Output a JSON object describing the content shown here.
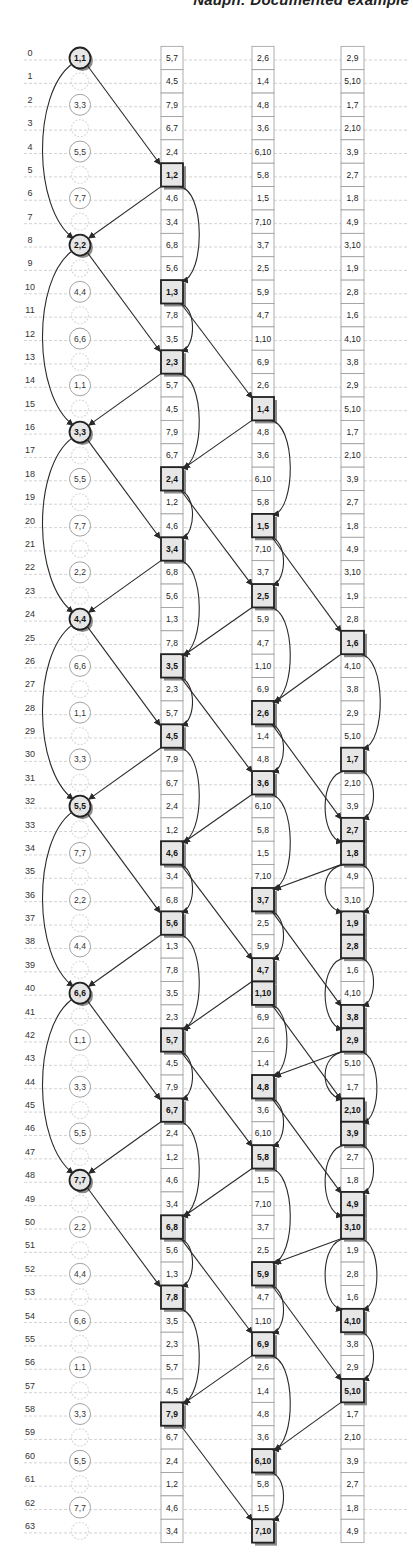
{
  "title": "Naupn: Documented example",
  "layout": {
    "row_count": 64,
    "row0_y": 58,
    "row_pitch": 23.38,
    "rownum_x": 30,
    "grid_x1": 24,
    "grid_x2": 408,
    "circle_x": 80,
    "circle_r": 10.5,
    "columns_x": [
      172,
      263,
      352.5
    ],
    "column_widths": [
      22,
      22,
      23
    ]
  },
  "colors": {
    "grid": "#c8c8c8",
    "cell_border": "#9a9a9a",
    "hl_border": "#222222",
    "hl_fill": "#e6e6e6",
    "shadow": "#8c8c8c",
    "arrow": "#2a2a2a",
    "ghost": "#dcdcdc"
  },
  "circles": [
    {
      "row": 0,
      "label": "1,1",
      "hl": true
    },
    {
      "row": 2,
      "label": "3,3",
      "hl": false
    },
    {
      "row": 4,
      "label": "5,5",
      "hl": false
    },
    {
      "row": 6,
      "label": "7,7",
      "hl": false
    },
    {
      "row": 8,
      "label": "2,2",
      "hl": true
    },
    {
      "row": 10,
      "label": "4,4",
      "hl": false
    },
    {
      "row": 12,
      "label": "6,6",
      "hl": false
    },
    {
      "row": 14,
      "label": "1,1",
      "hl": false
    },
    {
      "row": 16,
      "label": "3,3",
      "hl": true
    },
    {
      "row": 18,
      "label": "5,5",
      "hl": false
    },
    {
      "row": 20,
      "label": "7,7",
      "hl": false
    },
    {
      "row": 22,
      "label": "2,2",
      "hl": false
    },
    {
      "row": 24,
      "label": "4,4",
      "hl": true
    },
    {
      "row": 26,
      "label": "6,6",
      "hl": false
    },
    {
      "row": 28,
      "label": "1,1",
      "hl": false
    },
    {
      "row": 30,
      "label": "3,3",
      "hl": false
    },
    {
      "row": 32,
      "label": "5,5",
      "hl": true
    },
    {
      "row": 34,
      "label": "7,7",
      "hl": false
    },
    {
      "row": 36,
      "label": "2,2",
      "hl": false
    },
    {
      "row": 38,
      "label": "4,4",
      "hl": false
    },
    {
      "row": 40,
      "label": "6,6",
      "hl": true
    },
    {
      "row": 42,
      "label": "1,1",
      "hl": false
    },
    {
      "row": 44,
      "label": "3,3",
      "hl": false
    },
    {
      "row": 46,
      "label": "5,5",
      "hl": false
    },
    {
      "row": 48,
      "label": "7,7",
      "hl": true
    },
    {
      "row": 50,
      "label": "2,2",
      "hl": false
    },
    {
      "row": 52,
      "label": "4,4",
      "hl": false
    },
    {
      "row": 54,
      "label": "6,6",
      "hl": false
    },
    {
      "row": 56,
      "label": "1,1",
      "hl": false
    },
    {
      "row": 58,
      "label": "3,3",
      "hl": false
    },
    {
      "row": 60,
      "label": "5,5",
      "hl": false
    },
    {
      "row": 62,
      "label": "7,7",
      "hl": false
    }
  ],
  "columns": [
    {
      "cells": [
        "5,7",
        "4,5",
        "7,9",
        "6,7",
        "2,4",
        "1,2",
        "4,6",
        "3,4",
        "6,8",
        "5,6",
        "1,3",
        "7,8",
        "3,5",
        "2,3",
        "5,7",
        "4,5",
        "7,9",
        "6,7",
        "2,4",
        "1,2",
        "4,6",
        "3,4",
        "6,8",
        "5,6",
        "1,3",
        "7,8",
        "3,5",
        "2,3",
        "5,7",
        "4,5",
        "7,9",
        "6,7",
        "2,4",
        "1,2",
        "4,6",
        "3,4",
        "6,8",
        "5,6",
        "1,3",
        "7,8",
        "3,5",
        "2,3",
        "5,7",
        "4,5",
        "7,9",
        "6,7",
        "2,4",
        "1,2",
        "4,6",
        "3,4",
        "6,8",
        "5,6",
        "1,3",
        "7,8",
        "3,5",
        "2,3",
        "5,7",
        "4,5",
        "7,9",
        "6,7",
        "2,4",
        "1,2",
        "4,6",
        "3,4"
      ],
      "highlighted_rows": [
        5,
        10,
        13,
        18,
        21,
        26,
        29,
        34,
        37,
        42,
        45,
        50,
        53,
        58
      ]
    },
    {
      "cells": [
        "2,6",
        "1,4",
        "4,8",
        "3,6",
        "6,10",
        "5,8",
        "1,5",
        "7,10",
        "3,7",
        "2,5",
        "5,9",
        "4,7",
        "1,10",
        "6,9",
        "2,6",
        "1,4",
        "4,8",
        "3,6",
        "6,10",
        "5,8",
        "1,5",
        "7,10",
        "3,7",
        "2,5",
        "5,9",
        "4,7",
        "1,10",
        "6,9",
        "2,6",
        "1,4",
        "4,8",
        "3,6",
        "6,10",
        "5,8",
        "1,5",
        "7,10",
        "3,7",
        "2,5",
        "5,9",
        "4,7",
        "1,10",
        "6,9",
        "2,6",
        "1,4",
        "4,8",
        "3,6",
        "6,10",
        "5,8",
        "1,5",
        "7,10",
        "3,7",
        "2,5",
        "5,9",
        "4,7",
        "1,10",
        "6,9",
        "2,6",
        "1,4",
        "4,8",
        "3,6",
        "6,10",
        "5,8",
        "1,5",
        "7,10"
      ],
      "highlighted_rows": [
        15,
        20,
        23,
        28,
        31,
        36,
        39,
        40,
        44,
        47,
        52,
        55,
        60,
        63
      ]
    },
    {
      "cells": [
        "2,9",
        "5,10",
        "1,7",
        "2,10",
        "3,9",
        "2,7",
        "1,8",
        "4,9",
        "3,10",
        "1,9",
        "2,8",
        "1,6",
        "4,10",
        "3,8",
        "2,9",
        "5,10",
        "1,7",
        "2,10",
        "3,9",
        "2,7",
        "1,8",
        "4,9",
        "3,10",
        "1,9",
        "2,8",
        "1,6",
        "4,10",
        "3,8",
        "2,9",
        "5,10",
        "1,7",
        "2,10",
        "3,9",
        "2,7",
        "1,8",
        "4,9",
        "3,10",
        "1,9",
        "2,8",
        "1,6",
        "4,10",
        "3,8",
        "2,9",
        "5,10",
        "1,7",
        "2,10",
        "3,9",
        "2,7",
        "1,8",
        "4,9",
        "3,10",
        "1,9",
        "2,8",
        "1,6",
        "4,10",
        "3,8",
        "2,9",
        "5,10",
        "1,7",
        "2,10",
        "3,9",
        "2,7",
        "1,8",
        "4,9"
      ],
      "highlighted_rows": [
        25,
        30,
        33,
        34,
        37,
        38,
        41,
        42,
        45,
        46,
        49,
        50,
        54,
        57
      ]
    }
  ],
  "edges": {
    "circle_left_curves": [
      [
        0,
        8
      ],
      [
        8,
        16
      ],
      [
        16,
        24
      ],
      [
        24,
        32
      ],
      [
        32,
        40
      ],
      [
        40,
        48
      ]
    ],
    "circle_to_col": [
      [
        0,
        0,
        5
      ],
      [
        8,
        0,
        13
      ],
      [
        16,
        0,
        21
      ],
      [
        24,
        0,
        29
      ],
      [
        32,
        0,
        37
      ],
      [
        40,
        0,
        45
      ],
      [
        48,
        0,
        53
      ]
    ],
    "col_to_circle": [
      [
        0,
        5,
        8
      ],
      [
        0,
        13,
        16
      ],
      [
        0,
        21,
        24
      ],
      [
        0,
        29,
        32
      ],
      [
        0,
        37,
        40
      ],
      [
        0,
        45,
        48
      ]
    ],
    "col_right_curves": [
      [
        0,
        5,
        10
      ],
      [
        0,
        13,
        18
      ],
      [
        0,
        21,
        26
      ],
      [
        0,
        29,
        34
      ],
      [
        0,
        37,
        42
      ],
      [
        0,
        45,
        50
      ],
      [
        0,
        53,
        58
      ],
      [
        0,
        10,
        13
      ],
      [
        0,
        18,
        21
      ],
      [
        0,
        26,
        29
      ],
      [
        0,
        34,
        37
      ],
      [
        0,
        42,
        45
      ],
      [
        0,
        50,
        53
      ],
      [
        1,
        15,
        20
      ],
      [
        1,
        23,
        28
      ],
      [
        1,
        31,
        36
      ],
      [
        1,
        40,
        44
      ],
      [
        1,
        47,
        52
      ],
      [
        1,
        55,
        60
      ],
      [
        1,
        20,
        23
      ],
      [
        1,
        28,
        31
      ],
      [
        1,
        36,
        39
      ],
      [
        1,
        44,
        47
      ],
      [
        1,
        52,
        55
      ],
      [
        1,
        60,
        63
      ],
      [
        2,
        25,
        30
      ],
      [
        2,
        30,
        33
      ],
      [
        2,
        34,
        37
      ],
      [
        2,
        38,
        41
      ],
      [
        2,
        42,
        46
      ],
      [
        2,
        46,
        49
      ],
      [
        2,
        50,
        54
      ],
      [
        2,
        54,
        57
      ]
    ],
    "col_left_curves": [
      [
        2,
        30,
        34
      ],
      [
        2,
        34,
        37
      ],
      [
        2,
        38,
        42
      ],
      [
        2,
        42,
        45
      ],
      [
        2,
        46,
        50
      ],
      [
        2,
        50,
        54
      ]
    ],
    "cross_down": [
      [
        0,
        10,
        1,
        15
      ],
      [
        0,
        18,
        1,
        23
      ],
      [
        0,
        26,
        1,
        31
      ],
      [
        0,
        34,
        1,
        39
      ],
      [
        0,
        42,
        1,
        47
      ],
      [
        0,
        50,
        1,
        55
      ],
      [
        0,
        58,
        1,
        63
      ],
      [
        1,
        20,
        2,
        25
      ],
      [
        1,
        28,
        2,
        33
      ],
      [
        1,
        36,
        2,
        41
      ],
      [
        1,
        40,
        2,
        45
      ],
      [
        1,
        44,
        2,
        49
      ],
      [
        1,
        52,
        2,
        57
      ]
    ],
    "cross_back": [
      [
        1,
        15,
        0,
        18
      ],
      [
        1,
        23,
        0,
        26
      ],
      [
        1,
        31,
        0,
        34
      ],
      [
        1,
        39,
        0,
        42
      ],
      [
        1,
        47,
        0,
        50
      ],
      [
        1,
        55,
        0,
        58
      ],
      [
        2,
        25,
        1,
        28
      ],
      [
        2,
        34,
        1,
        36
      ],
      [
        2,
        42,
        1,
        44
      ],
      [
        2,
        50,
        1,
        52
      ],
      [
        2,
        57,
        1,
        60
      ]
    ]
  }
}
